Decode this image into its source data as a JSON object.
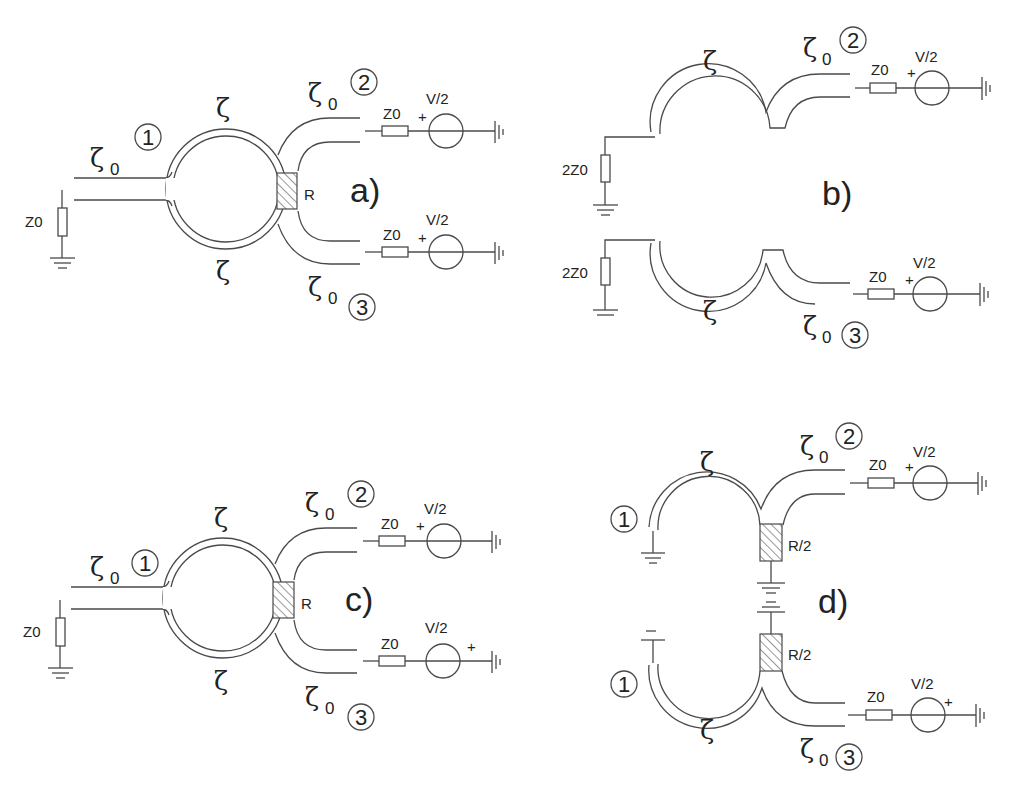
{
  "figure": {
    "panels": [
      {
        "id": "a",
        "label": "a)",
        "input_line_label": "ζ",
        "input_line_sub": "0",
        "ring_label_top": "ζ",
        "ring_label_bottom": "ζ",
        "out_top_label": "ζ",
        "out_top_sub": "0",
        "out_bottom_label": "ζ",
        "out_bottom_sub": "0",
        "port_in": "1",
        "port_top": "2",
        "port_bottom": "3",
        "load_in": "Z0",
        "isolation_resistor": "R",
        "src_top_res": "Z0",
        "src_top_volt": "V/2",
        "src_top_pol": "+",
        "src_bot_res": "Z0",
        "src_bot_volt": "V/2",
        "src_bot_pol": "+"
      },
      {
        "id": "b",
        "label": "b)",
        "arc_top_label": "ζ",
        "arc_bottom_label": "ζ",
        "out_top_label": "ζ",
        "out_top_sub": "0",
        "out_bottom_label": "ζ",
        "out_bottom_sub": "0",
        "port_top": "2",
        "port_bottom": "3",
        "load_top": "2Z0",
        "load_bottom": "2Z0",
        "src_top_res": "Z0",
        "src_top_volt": "V/2",
        "src_top_pol": "+",
        "src_bot_res": "Z0",
        "src_bot_volt": "V/2",
        "src_bot_pol": "+"
      },
      {
        "id": "c",
        "label": "c)",
        "input_line_label": "ζ",
        "input_line_sub": "0",
        "ring_label_top": "ζ",
        "ring_label_bottom": "ζ",
        "out_top_label": "ζ",
        "out_top_sub": "0",
        "out_bottom_label": "ζ",
        "out_bottom_sub": "0",
        "port_in": "1",
        "port_top": "2",
        "port_bottom": "3",
        "load_in": "Z0",
        "isolation_resistor": "R",
        "src_top_res": "Z0",
        "src_top_volt": "V/2",
        "src_top_pol": "+",
        "src_bot_res": "Z0",
        "src_bot_volt": "V/2",
        "src_bot_pol": "+"
      },
      {
        "id": "d",
        "label": "d)",
        "arc_top_label": "ζ",
        "arc_bottom_label": "ζ",
        "out_top_label": "ζ",
        "out_top_sub": "0",
        "out_bottom_label": "ζ",
        "out_bottom_sub": "0",
        "port_in_top": "1",
        "port_in_bottom": "1",
        "port_top": "2",
        "port_bottom": "3",
        "res_top": "R/2",
        "res_bottom": "R/2",
        "src_top_res": "Z0",
        "src_top_volt": "V/2",
        "src_top_pol": "+",
        "src_bot_res": "Z0",
        "src_bot_volt": "V/2",
        "src_bot_pol": "+"
      }
    ]
  }
}
